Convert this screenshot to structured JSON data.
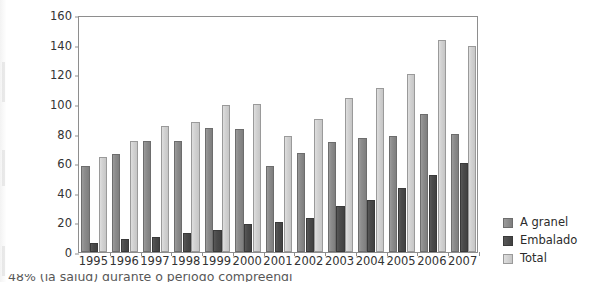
{
  "chart_data": {
    "type": "bar",
    "title": "",
    "subtitle": "",
    "xlabel": "",
    "ylabel": "",
    "ylim": [
      0,
      160
    ],
    "ytick_step": 20,
    "yticks": [
      0,
      20,
      40,
      60,
      80,
      100,
      120,
      140,
      160
    ],
    "grid": false,
    "legend_position": "right-bottom",
    "categories": [
      "1995",
      "1996",
      "1997",
      "1998",
      "1999",
      "2000",
      "2001",
      "2002",
      "2003",
      "2004",
      "2005",
      "2006",
      "2007"
    ],
    "series": [
      {
        "name": "A granel",
        "color": "#8d8d8d",
        "values": [
          58,
          66,
          75,
          75,
          84,
          83,
          58,
          67,
          74,
          77,
          78,
          93,
          80
        ]
      },
      {
        "name": "Embalado",
        "color": "#4b4b4b",
        "values": [
          6,
          9,
          10,
          13,
          15,
          19,
          20,
          23,
          31,
          35,
          43,
          52,
          60
        ]
      },
      {
        "name": "Total",
        "color": "#d2d2d2",
        "values": [
          64,
          75,
          85,
          88,
          99,
          100,
          78,
          90,
          104,
          111,
          120,
          143,
          139
        ]
      }
    ]
  },
  "legend": {
    "items": [
      {
        "label": "A granel",
        "swatch": "granel"
      },
      {
        "label": "Embalado",
        "swatch": "embalado"
      },
      {
        "label": "Total",
        "swatch": "total"
      }
    ]
  },
  "caption": {
    "text": "48% (la salud) durante o período compreendi"
  }
}
